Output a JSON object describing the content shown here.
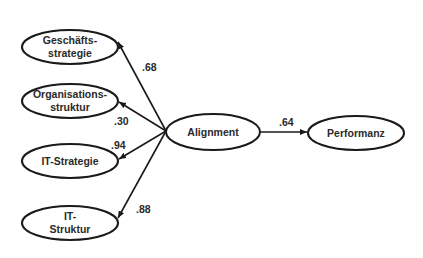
{
  "nodes": {
    "geschaeftsstrategie": {
      "line1": "Geschäfts-",
      "line2": "strategie"
    },
    "organisationsstruktur": {
      "line1": "Organisations-",
      "line2": "struktur"
    },
    "it_strategie": {
      "line1": "IT-Strategie"
    },
    "it_struktur": {
      "line1": "IT-",
      "line2": "Struktur"
    },
    "alignment": {
      "line1": "Alignment"
    },
    "performanz": {
      "line1": "Performanz"
    }
  },
  "edges": {
    "alignment_to_geschaeftsstrategie": ".68",
    "alignment_to_organisationsstruktur": ".30",
    "alignment_to_it_strategie": ".94",
    "alignment_to_it_struktur": ".88",
    "alignment_to_performanz": ".64"
  },
  "colors": {
    "stroke": "#1a1a1a",
    "text": "#2a2a2a",
    "background": "#ffffff"
  }
}
